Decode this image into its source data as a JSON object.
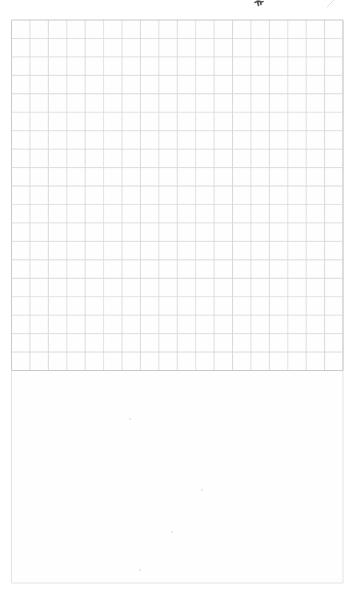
{
  "canvas": {
    "width": 357,
    "height": 596,
    "background": "#ffffff"
  },
  "paper": {
    "left": 11.5,
    "top": 20,
    "right": 343,
    "bottom": 583,
    "fill": "#fefefe",
    "edge_color": "#e4e4e8",
    "edge_width": 1
  },
  "grid": {
    "x": 11.5,
    "y": 20,
    "width": 331.5,
    "height": 350.5,
    "columns": 18,
    "rows": 19,
    "line_color": "#d8d8dc",
    "border_color": "#c8c8ce",
    "line_width": 1
  },
  "marks": {
    "ink_stroke": {
      "x": 255,
      "y": 0,
      "color": "#4f4f4f",
      "stroke_width": 1.6,
      "path": "M 0 2.5 Q 2.5 0.5 5 1.5 Q 7 2.5 8 1.5 M 2.5 1.5 L 3.5 5.5 M 5.5 2 L 6 4.5"
    },
    "faint_stroke": {
      "x": 327,
      "y": 0,
      "color": "#dddde0",
      "stroke_width": 1,
      "path": "M 7 0 L 0 7"
    },
    "speck_color": "#e2e2e6",
    "specks": [
      {
        "x": 130,
        "y": 419
      },
      {
        "x": 202,
        "y": 490
      },
      {
        "x": 172,
        "y": 532
      },
      {
        "x": 140,
        "y": 570
      }
    ]
  }
}
